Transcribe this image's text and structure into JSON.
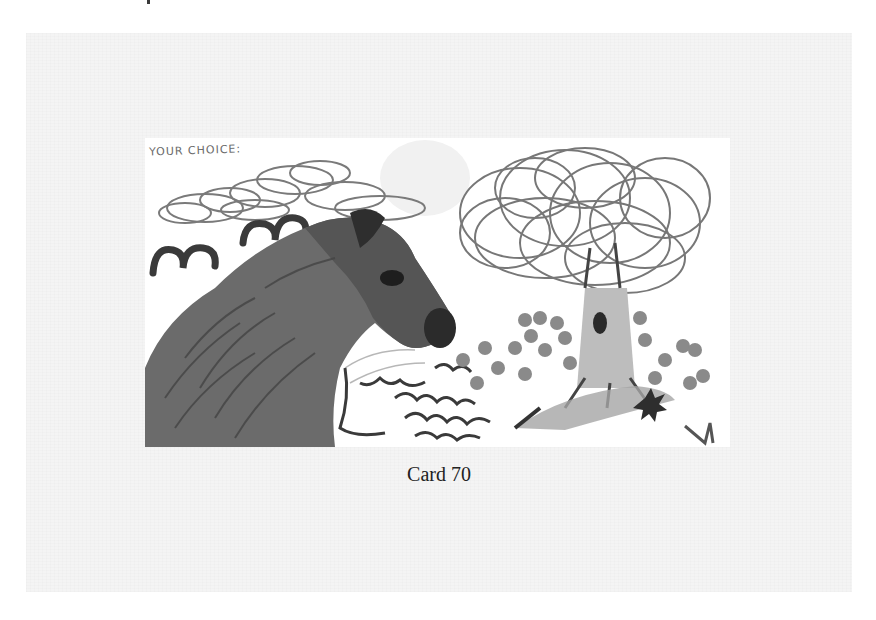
{
  "card": {
    "handwritten_label": "YOUR CHOICE:",
    "caption": "Card 70",
    "illustration": {
      "subject": "pencil/marker drawing of a horse head beside a large scribbled tree with flowers",
      "elements": [
        "clouds",
        "birds",
        "horse",
        "tree",
        "flowers",
        "grass",
        "wavy lines"
      ]
    }
  },
  "colors": {
    "page_background": "#ffffff",
    "panel_background": "#f4f4f4",
    "image_background": "#ffffff",
    "caption_text": "#222222",
    "ink_dark": "#2e2e2e",
    "ink_mid": "#6a6a6a",
    "ink_light": "#9a9a9a"
  }
}
